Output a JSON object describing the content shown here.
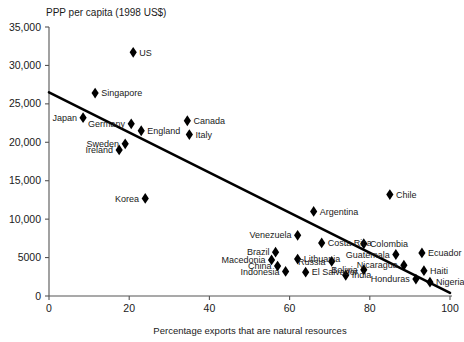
{
  "chart_data": {
    "type": "scatter",
    "title": "PPP per capita (1998 US$)",
    "xlabel": "Percentage exports that are natural resources",
    "ylabel": "PPP per capita (1998 US$)",
    "xlim": [
      0,
      100
    ],
    "ylim": [
      0,
      35000
    ],
    "grid": false,
    "legend": false,
    "xticks": [
      "0",
      "20",
      "40",
      "60",
      "80",
      "100"
    ],
    "xtick_values": [
      0,
      20,
      40,
      60,
      80,
      100
    ],
    "yticks": [
      "0",
      "5000",
      "10,000",
      "15,000",
      "20,000",
      "25,000",
      "30,000",
      "35,000"
    ],
    "ytick_values": [
      0,
      5000,
      10000,
      15000,
      20000,
      25000,
      30000,
      35000
    ],
    "trend_line": {
      "x0": 0,
      "y0": 26500,
      "x1": 100,
      "y1": 400
    },
    "points": [
      {
        "name": "US",
        "x": 21.0,
        "y": 31700,
        "label_side": "right"
      },
      {
        "name": "Singapore",
        "x": 11.5,
        "y": 26400,
        "label_side": "right"
      },
      {
        "name": "Japan",
        "x": 8.5,
        "y": 23200,
        "label_side": "left"
      },
      {
        "name": "Germany",
        "x": 20.5,
        "y": 22400,
        "label_side": "left"
      },
      {
        "name": "Canada",
        "x": 34.5,
        "y": 22800,
        "label_side": "right"
      },
      {
        "name": "England",
        "x": 23.0,
        "y": 21500,
        "label_side": "right"
      },
      {
        "name": "Italy",
        "x": 35.0,
        "y": 21000,
        "label_side": "right"
      },
      {
        "name": "Sweden",
        "x": 19.0,
        "y": 19800,
        "label_side": "left"
      },
      {
        "name": "Ireland",
        "x": 17.5,
        "y": 19000,
        "label_side": "left"
      },
      {
        "name": "Korea",
        "x": 24.0,
        "y": 12700,
        "label_side": "left"
      },
      {
        "name": "Chile",
        "x": 85.0,
        "y": 13200,
        "label_side": "right"
      },
      {
        "name": "Argentina",
        "x": 66.0,
        "y": 11000,
        "label_side": "right"
      },
      {
        "name": "Venezuela",
        "x": 62.0,
        "y": 7900,
        "label_side": "left"
      },
      {
        "name": "Costa Rica",
        "x": 68.0,
        "y": 6900,
        "label_side": "right"
      },
      {
        "name": "Colombia",
        "x": 78.5,
        "y": 6800,
        "label_side": "right"
      },
      {
        "name": "Ecuador",
        "x": 93.0,
        "y": 5600,
        "label_side": "right"
      },
      {
        "name": "Brazil",
        "x": 56.5,
        "y": 5700,
        "label_side": "left"
      },
      {
        "name": "Guatemala",
        "x": 86.5,
        "y": 5400,
        "label_side": "left"
      },
      {
        "name": "Lithuania",
        "x": 62.0,
        "y": 4800,
        "label_side": "right"
      },
      {
        "name": "Macedonia",
        "x": 55.5,
        "y": 4700,
        "label_side": "left"
      },
      {
        "name": "Russia",
        "x": 70.5,
        "y": 4500,
        "label_side": "left"
      },
      {
        "name": "Nicaragua",
        "x": 88.5,
        "y": 4000,
        "label_side": "left"
      },
      {
        "name": "China",
        "x": 57.0,
        "y": 3900,
        "label_side": "left"
      },
      {
        "name": "Haiti",
        "x": 93.5,
        "y": 3300,
        "label_side": "right"
      },
      {
        "name": "Bolivia",
        "x": 78.5,
        "y": 3400,
        "label_side": "left"
      },
      {
        "name": "Indonesia",
        "x": 59.0,
        "y": 3200,
        "label_side": "left"
      },
      {
        "name": "El Salvador",
        "x": 64.0,
        "y": 3100,
        "label_side": "right"
      },
      {
        "name": "India",
        "x": 74.0,
        "y": 2700,
        "label_side": "right"
      },
      {
        "name": "Honduras",
        "x": 91.5,
        "y": 2200,
        "label_side": "left"
      },
      {
        "name": "Nigeria",
        "x": 95.0,
        "y": 1800,
        "label_side": "right"
      }
    ]
  }
}
